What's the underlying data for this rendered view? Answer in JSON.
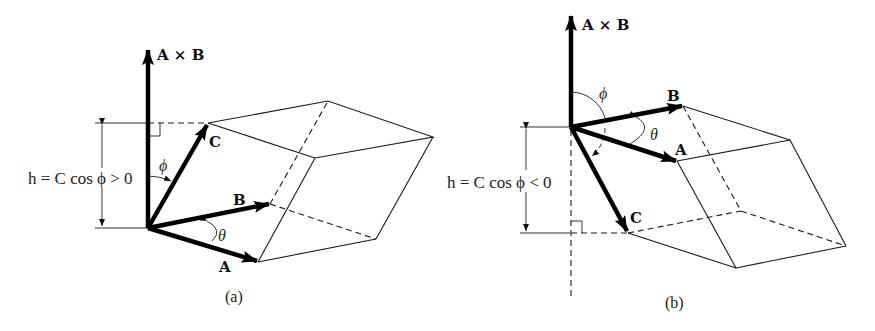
{
  "figure": {
    "panels": [
      {
        "id": "a",
        "caption": "(a)",
        "cross_label": "A × B",
        "vector_labels": {
          "A": "A",
          "B": "B",
          "C": "C"
        },
        "angle_labels": {
          "phi": "ϕ",
          "theta": "θ"
        },
        "height_equation": "h = C cos ϕ > 0"
      },
      {
        "id": "b",
        "caption": "(b)",
        "cross_label": "A × B",
        "vector_labels": {
          "A": "A",
          "B": "B",
          "C": "C"
        },
        "angle_labels": {
          "phi": "ϕ",
          "theta": "θ"
        },
        "height_equation": "h = C cos ϕ < 0"
      }
    ]
  }
}
